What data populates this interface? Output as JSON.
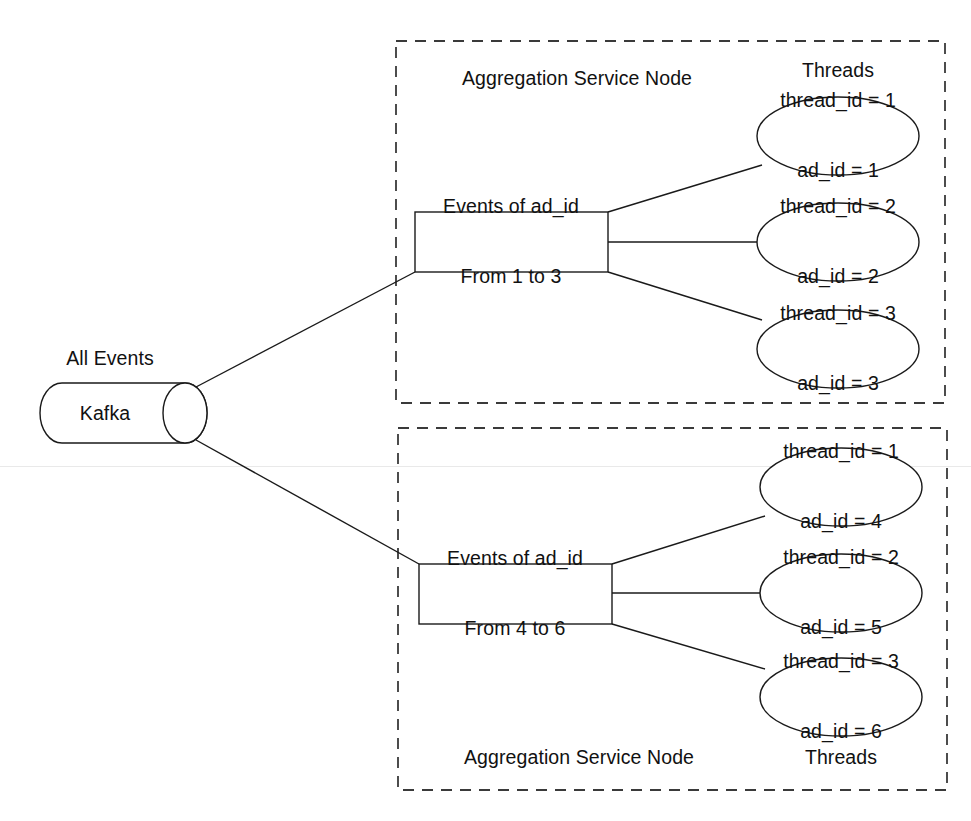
{
  "diagram": {
    "source": {
      "name": "kafka-cylinder",
      "label": "Kafka",
      "caption": "All Events"
    },
    "groups": [
      {
        "id": "aggregation-node-top",
        "label": "Aggregation Service Node",
        "threads_label": "Threads",
        "label_position": "top",
        "partition": {
          "line1": "Events of ad_id",
          "line2": "From 1 to 3"
        },
        "threads": [
          {
            "line1": "thread_id = 1",
            "line2": "ad_id = 1"
          },
          {
            "line1": "thread_id = 2",
            "line2": "ad_id = 2"
          },
          {
            "line1": "thread_id = 3",
            "line2": "ad_id = 3"
          }
        ]
      },
      {
        "id": "aggregation-node-bottom",
        "label": "Aggregation Service Node",
        "threads_label": "Threads",
        "label_position": "bottom",
        "partition": {
          "line1": "Events of ad_id",
          "line2": "From 4 to 6"
        },
        "threads": [
          {
            "line1": "thread_id = 1",
            "line2": "ad_id = 4"
          },
          {
            "line1": "thread_id = 2",
            "line2": "ad_id = 5"
          },
          {
            "line1": "thread_id = 3",
            "line2": "ad_id = 6"
          }
        ]
      }
    ],
    "colors": {
      "stroke": "#1a1a1a",
      "group_stroke": "#3a3a3a",
      "background": "#ffffff",
      "text": "#111111"
    }
  }
}
